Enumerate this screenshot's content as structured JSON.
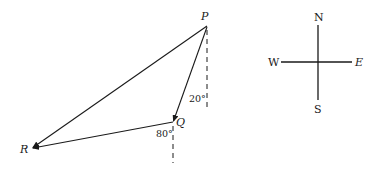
{
  "diagram": {
    "points": {
      "P": {
        "label": "P",
        "x": 207,
        "y": 25
      },
      "Q": {
        "label": "Q",
        "x": 173,
        "y": 122
      },
      "R": {
        "label": "R",
        "x": 32,
        "y": 148
      }
    },
    "vectors": [
      {
        "from": "P",
        "to": "Q",
        "name": "vector-pq"
      },
      {
        "from": "Q",
        "to": "R",
        "name": "vector-qr"
      },
      {
        "from": "P",
        "to": "R",
        "name": "vector-pr"
      }
    ],
    "angles": {
      "at_P": "20°",
      "at_Q": "80°"
    },
    "compass": {
      "north": "N",
      "south": "S",
      "east": "E",
      "west": "W"
    },
    "colors": {
      "line": "#1a1a1a",
      "background": "#ffffff"
    }
  }
}
